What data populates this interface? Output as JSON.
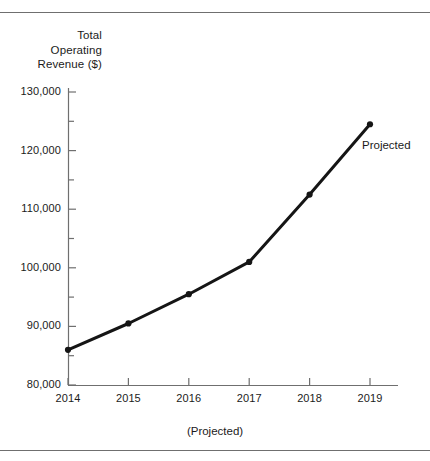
{
  "figure": {
    "axis_title_lines": [
      "Total",
      "Operating",
      "Revenue ($)"
    ],
    "x_axis_caption": "(Projected)",
    "annotation": "Projected",
    "line_color": "#151515",
    "rule_color": "#6f6f6f",
    "axis_color": "#6f6f6f"
  },
  "chart_data": {
    "type": "line",
    "title": "",
    "xlabel": "(Projected)",
    "ylabel": "Total Operating Revenue ($)",
    "categories": [
      "2014",
      "2015",
      "2016",
      "2017",
      "2018",
      "2019"
    ],
    "x": [
      2014,
      2015,
      2016,
      2017,
      2018,
      2019
    ],
    "values": [
      86000,
      90500,
      95500,
      101000,
      112500,
      124500
    ],
    "series": [
      {
        "name": "Total Operating Revenue",
        "values": [
          86000,
          90500,
          95500,
          101000,
          112500,
          124500
        ]
      }
    ],
    "ylim": [
      80000,
      132000
    ],
    "ytick_labels": [
      "80,000",
      "90,000",
      "100,000",
      "110,000",
      "120,000",
      "130,000"
    ],
    "ytick_values": [
      80000,
      90000,
      100000,
      110000,
      120000,
      130000
    ],
    "yminor_values": [
      85000,
      95000,
      105000,
      115000,
      125000
    ],
    "xtick_labels": [
      "2014",
      "2015",
      "2016",
      "2017",
      "2018",
      "2019"
    ],
    "grid": false,
    "legend": "none",
    "markers": true,
    "annotations": [
      {
        "text": "Projected",
        "x": 2019,
        "y": 124500
      }
    ]
  }
}
